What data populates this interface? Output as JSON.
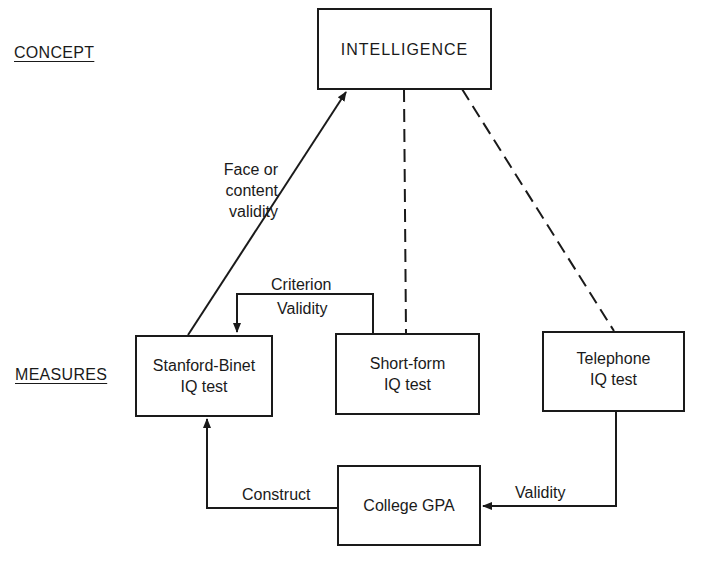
{
  "levels": {
    "concept": "CONCEPT",
    "measures": "MEASURES"
  },
  "nodes": {
    "intelligence": "INTELLIGENCE",
    "stanford_binet": "Stanford-Binet\nIQ test",
    "short_form": "Short-form\nIQ test",
    "telephone": "Telephone\nIQ test",
    "college_gpa": "College GPA"
  },
  "edges": {
    "face_content": "Face or\ncontent\nvalidity",
    "criterion_top": "Criterion",
    "criterion_bottom": "Validity",
    "construct": "Construct",
    "validity": "Validity"
  },
  "colors": {
    "ink": "#1a1a1a",
    "background": "#ffffff"
  }
}
